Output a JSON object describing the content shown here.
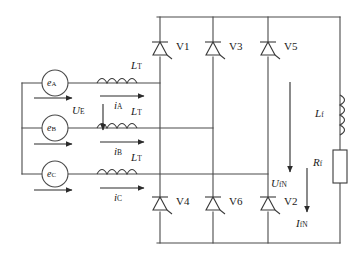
{
  "diagram": {
    "sources": [
      {
        "id": "src-a",
        "symbol": "e",
        "subscript": "A",
        "current_symbol": "i",
        "current_subscript": "A",
        "inductor_symbol": "L",
        "inductor_subscript": "T"
      },
      {
        "id": "src-b",
        "symbol": "e",
        "subscript": "B",
        "current_symbol": "i",
        "current_subscript": "B",
        "inductor_symbol": "L",
        "inductor_subscript": "T"
      },
      {
        "id": "src-c",
        "symbol": "e",
        "subscript": "C",
        "current_symbol": "i",
        "current_subscript": "C",
        "inductor_symbol": "L",
        "inductor_subscript": "T"
      }
    ],
    "source_voltage": {
      "symbol": "U",
      "subscript": "E"
    },
    "thyristors_upper": [
      {
        "label": "V1"
      },
      {
        "label": "V3"
      },
      {
        "label": "V5"
      }
    ],
    "thyristors_lower": [
      {
        "label": "V4"
      },
      {
        "label": "V6"
      },
      {
        "label": "V2"
      }
    ],
    "load": {
      "inductor": {
        "symbol": "L",
        "subscript": "f"
      },
      "resistor": {
        "symbol": "R",
        "subscript": "f"
      },
      "voltage": {
        "symbol": "U",
        "subscript": "fN"
      },
      "current": {
        "symbol": "I",
        "subscript": "fN"
      }
    },
    "colors": {
      "wire": "#4a4a4a",
      "component": "#3a3a3a",
      "text": "#1a1a1a",
      "background": "#ffffff"
    }
  }
}
